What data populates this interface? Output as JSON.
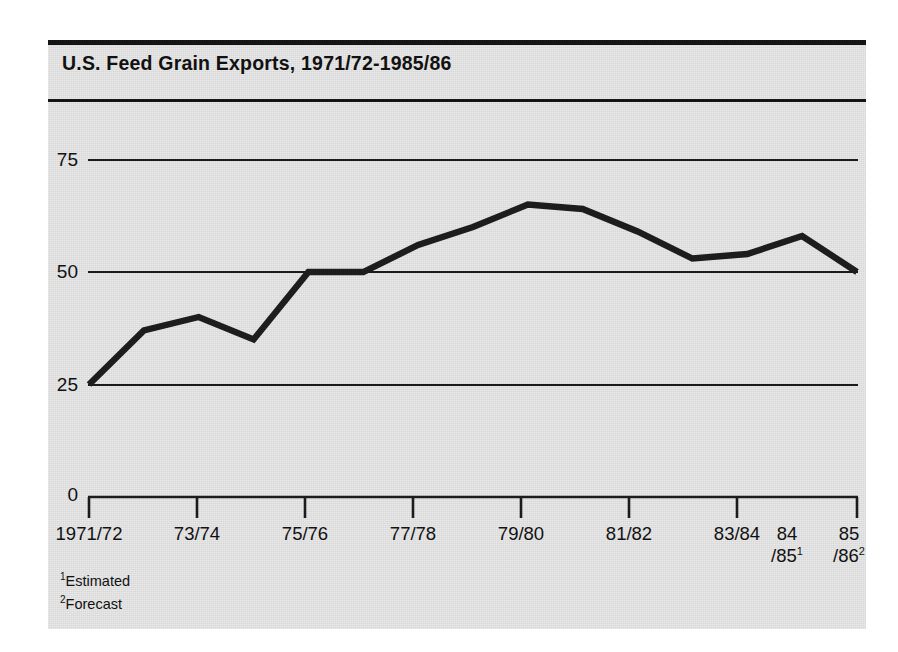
{
  "chart_data": {
    "type": "line",
    "title": "U.S. Feed Grain Exports, 1971/72-1985/86",
    "xlabel": "",
    "ylabel": "",
    "ylim": [
      0,
      82
    ],
    "yticks": [
      0,
      25,
      50,
      75
    ],
    "ytick_labels": [
      "0",
      "25",
      "50",
      "75"
    ],
    "grid": "horizontal",
    "legend": "none",
    "categories": [
      "1971/72",
      "72/73",
      "73/74",
      "74/75",
      "75/76",
      "76/77",
      "77/78",
      "78/79",
      "79/80",
      "80/81",
      "81/82",
      "82/83",
      "83/84",
      "84/85",
      "85/86"
    ],
    "xtick_labels": [
      "1971/72",
      "73/74",
      "75/76",
      "77/78",
      "79/80",
      "81/82",
      "83/84",
      "84/85",
      "85/86"
    ],
    "values": [
      25,
      37,
      40,
      35,
      50,
      50,
      56,
      60,
      65,
      64,
      59,
      53,
      54,
      58,
      50
    ],
    "series": [
      {
        "name": "U.S. Feed Grain Exports",
        "values": [
          25,
          37,
          40,
          35,
          50,
          50,
          56,
          60,
          65,
          64,
          59,
          53,
          54,
          58,
          50
        ]
      }
    ],
    "annotations": [
      "1Estimated",
      "2Forecast"
    ]
  },
  "title": "U.S. Feed Grain Exports, 1971/72-1985/86",
  "axis": {
    "y_ticks": [
      {
        "label": "75",
        "value": 75
      },
      {
        "label": "50",
        "value": 50
      },
      {
        "label": "25",
        "value": 25
      },
      {
        "label": "0",
        "value": 0
      }
    ],
    "x_ticks": [
      {
        "line1": "1971/72",
        "line2": "",
        "sup": ""
      },
      {
        "line1": "73/74",
        "line2": "",
        "sup": ""
      },
      {
        "line1": "75/76",
        "line2": "",
        "sup": ""
      },
      {
        "line1": "77/78",
        "line2": "",
        "sup": ""
      },
      {
        "line1": "79/80",
        "line2": "",
        "sup": ""
      },
      {
        "line1": "81/82",
        "line2": "",
        "sup": ""
      },
      {
        "line1": "83/84",
        "line2": "",
        "sup": ""
      },
      {
        "line1": "84",
        "line2": "/85",
        "sup": "1"
      },
      {
        "line1": "85",
        "line2": "/86",
        "sup": "2"
      }
    ]
  },
  "footnotes": [
    {
      "marker": "1",
      "text": "Estimated"
    },
    {
      "marker": "2",
      "text": "Forecast"
    }
  ],
  "colors": {
    "panel_background": "#d7d7d7",
    "page_background": "#ffffff",
    "ink": "#1b1b1b",
    "data_line": "#1d1d1d"
  }
}
